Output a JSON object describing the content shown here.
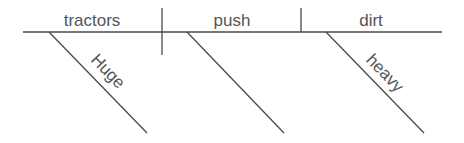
{
  "diagram": {
    "type": "sentence-diagram",
    "sentence": "Huge tractors push dirt heavy",
    "subject": "tractors",
    "verb": "push",
    "object": "dirt",
    "modifiers": {
      "subject": "Huge",
      "verb": "",
      "object": "heavy"
    },
    "colors": {
      "line": "#4a4a4a",
      "text": "#555555",
      "background": "#ffffff"
    }
  }
}
